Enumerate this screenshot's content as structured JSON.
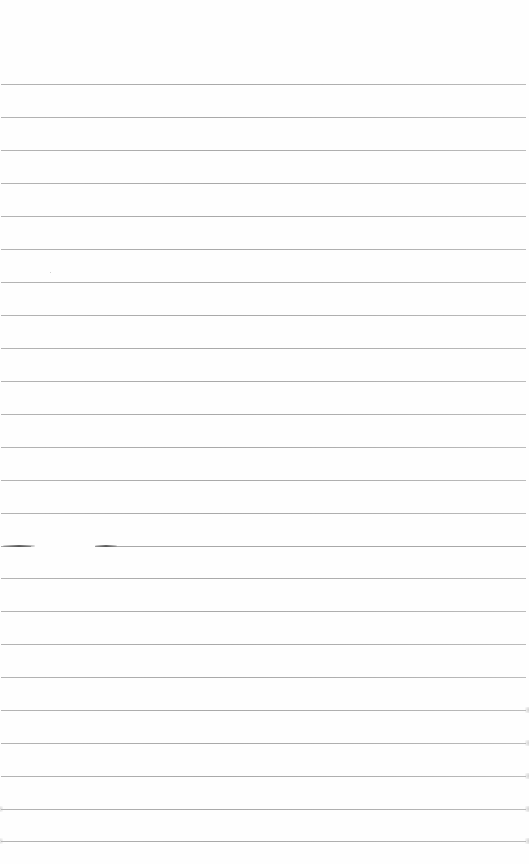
{
  "document": {
    "type": "blank ruled sheet",
    "text_content": "",
    "line_color": "#aaaaaa",
    "background_color": "#ffffff",
    "rule_count": 24,
    "first_rule_y": 84,
    "rule_spacing_px": 32.9
  },
  "rules": [
    {
      "y": 84
    },
    {
      "y": 117
    },
    {
      "y": 150
    },
    {
      "y": 183
    },
    {
      "y": 216
    },
    {
      "y": 249
    },
    {
      "y": 282
    },
    {
      "y": 315
    },
    {
      "y": 348
    },
    {
      "y": 381
    },
    {
      "y": 414
    },
    {
      "y": 447
    },
    {
      "y": 480
    },
    {
      "y": 513
    },
    {
      "y": 546,
      "broken": true
    },
    {
      "y": 578
    },
    {
      "y": 611
    },
    {
      "y": 644
    },
    {
      "y": 677
    },
    {
      "y": 710
    },
    {
      "y": 743
    },
    {
      "y": 776
    },
    {
      "y": 809
    },
    {
      "y": 841
    }
  ],
  "marks": [
    {
      "type": "smudge",
      "x": 3,
      "y": 545,
      "w": 32
    },
    {
      "type": "smudge",
      "x": 95,
      "y": 545,
      "w": 22
    }
  ]
}
